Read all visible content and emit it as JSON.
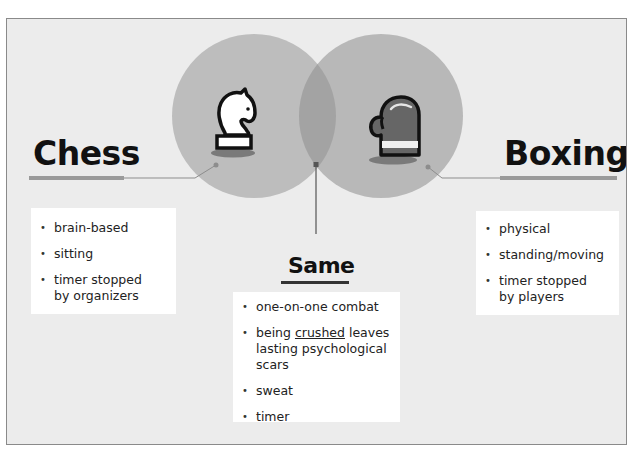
{
  "diagram": {
    "type": "venn",
    "colors": {
      "background": "#ececec",
      "left_circle": "#bdbdbd",
      "right_circle": "#b8b8b8",
      "overlap": "#a3a3a3",
      "underline_bar": "#9a9a9a",
      "connector": "#7a7a7a",
      "glove_fill": "#666666"
    },
    "left": {
      "title": "Chess",
      "icon": "chess-knight-icon",
      "items": [
        "brain-based",
        "sitting",
        "timer stopped by organizers"
      ]
    },
    "right": {
      "title": "Boxing",
      "icon": "boxing-glove-icon",
      "items": [
        "physical",
        "standing/moving",
        "timer stopped by players"
      ]
    },
    "center": {
      "title": "Same",
      "items": [
        {
          "before": "being ",
          "underlined": "crushed",
          "after": " leaves lasting psychological scars"
        }
      ],
      "item_one": "one-on-one combat",
      "item_three": "sweat",
      "item_four": "timer"
    }
  }
}
